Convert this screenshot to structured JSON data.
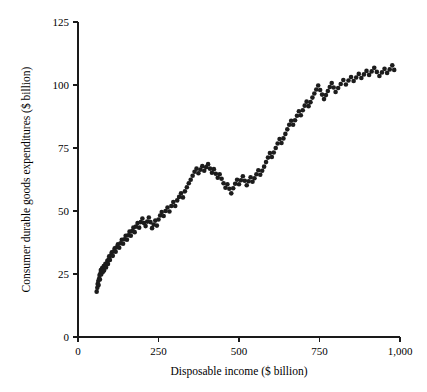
{
  "chart_data": {
    "type": "scatter",
    "title": "",
    "xlabel": "Disposable income ($ billion)",
    "ylabel": "Consumer durable goods expenditures ($ billion)",
    "xlim": [
      0,
      1000
    ],
    "ylim": [
      0,
      125
    ],
    "xticks": [
      0,
      250,
      500,
      750,
      1000
    ],
    "xtick_labels": [
      "0",
      "250",
      "500",
      "750",
      "1,000"
    ],
    "yticks": [
      0,
      25,
      50,
      75,
      100,
      125
    ],
    "ytick_labels": [
      "0",
      "25",
      "50",
      "75",
      "100",
      "125"
    ],
    "grid": false,
    "legend": null,
    "marker": {
      "shape": "circle",
      "color": "#1c1c1c",
      "size_px": 4.6
    },
    "series": [
      {
        "name": "Consumer durable goods expenditures vs disposable income",
        "color": "#1c1c1c",
        "points": [
          [
            58,
            18.0
          ],
          [
            60,
            19.5
          ],
          [
            61,
            21.0
          ],
          [
            63,
            22.2
          ],
          [
            64,
            20.6
          ],
          [
            66,
            23.3
          ],
          [
            67,
            24.6
          ],
          [
            68,
            22.8
          ],
          [
            70,
            25.4
          ],
          [
            71,
            26.6
          ],
          [
            72,
            24.8
          ],
          [
            74,
            26.0
          ],
          [
            75,
            27.4
          ],
          [
            77,
            25.8
          ],
          [
            78,
            27.0
          ],
          [
            80,
            28.2
          ],
          [
            81,
            26.4
          ],
          [
            83,
            27.8
          ],
          [
            85,
            29.0
          ],
          [
            87,
            27.6
          ],
          [
            89,
            28.8
          ],
          [
            91,
            30.2
          ],
          [
            93,
            29.0
          ],
          [
            95,
            30.8
          ],
          [
            97,
            32.0
          ],
          [
            99,
            30.6
          ],
          [
            102,
            32.4
          ],
          [
            105,
            33.6
          ],
          [
            108,
            32.2
          ],
          [
            111,
            34.0
          ],
          [
            114,
            35.2
          ],
          [
            117,
            33.8
          ],
          [
            120,
            35.6
          ],
          [
            124,
            36.8
          ],
          [
            128,
            35.4
          ],
          [
            132,
            37.2
          ],
          [
            136,
            38.6
          ],
          [
            140,
            37.0
          ],
          [
            144,
            38.8
          ],
          [
            148,
            40.2
          ],
          [
            152,
            38.6
          ],
          [
            156,
            40.4
          ],
          [
            160,
            41.8
          ],
          [
            164,
            40.2
          ],
          [
            168,
            42.0
          ],
          [
            172,
            43.4
          ],
          [
            176,
            41.6
          ],
          [
            180,
            43.8
          ],
          [
            185,
            45.2
          ],
          [
            190,
            43.4
          ],
          [
            195,
            45.6
          ],
          [
            200,
            47.0
          ],
          [
            205,
            45.2
          ],
          [
            210,
            44.0
          ],
          [
            215,
            45.8
          ],
          [
            220,
            47.4
          ],
          [
            225,
            45.6
          ],
          [
            230,
            43.2
          ],
          [
            235,
            44.6
          ],
          [
            240,
            46.2
          ],
          [
            245,
            44.2
          ],
          [
            250,
            46.6
          ],
          [
            255,
            48.2
          ],
          [
            260,
            49.6
          ],
          [
            266,
            48.0
          ],
          [
            272,
            50.0
          ],
          [
            278,
            51.4
          ],
          [
            284,
            49.8
          ],
          [
            290,
            52.0
          ],
          [
            296,
            53.6
          ],
          [
            302,
            52.0
          ],
          [
            308,
            54.2
          ],
          [
            314,
            55.6
          ],
          [
            320,
            57.0
          ],
          [
            326,
            55.4
          ],
          [
            332,
            57.8
          ],
          [
            338,
            59.4
          ],
          [
            344,
            61.0
          ],
          [
            350,
            62.4
          ],
          [
            356,
            64.0
          ],
          [
            362,
            65.6
          ],
          [
            368,
            66.8
          ],
          [
            374,
            65.0
          ],
          [
            380,
            66.4
          ],
          [
            386,
            67.8
          ],
          [
            392,
            66.0
          ],
          [
            398,
            67.4
          ],
          [
            404,
            68.6
          ],
          [
            410,
            66.8
          ],
          [
            416,
            65.2
          ],
          [
            422,
            66.6
          ],
          [
            428,
            64.8
          ],
          [
            434,
            63.2
          ],
          [
            440,
            64.6
          ],
          [
            446,
            62.8
          ],
          [
            452,
            61.0
          ],
          [
            458,
            59.2
          ],
          [
            464,
            60.6
          ],
          [
            470,
            58.8
          ],
          [
            476,
            57.0
          ],
          [
            482,
            59.0
          ],
          [
            488,
            60.8
          ],
          [
            494,
            62.4
          ],
          [
            500,
            60.6
          ],
          [
            506,
            62.2
          ],
          [
            512,
            63.8
          ],
          [
            518,
            62.0
          ],
          [
            524,
            60.2
          ],
          [
            530,
            61.8
          ],
          [
            536,
            63.4
          ],
          [
            542,
            61.6
          ],
          [
            548,
            63.0
          ],
          [
            554,
            64.6
          ],
          [
            560,
            66.2
          ],
          [
            566,
            64.4
          ],
          [
            572,
            66.0
          ],
          [
            578,
            67.6
          ],
          [
            584,
            69.4
          ],
          [
            590,
            71.2
          ],
          [
            596,
            73.0
          ],
          [
            602,
            71.4
          ],
          [
            608,
            73.2
          ],
          [
            614,
            75.0
          ],
          [
            620,
            76.8
          ],
          [
            626,
            78.6
          ],
          [
            632,
            77.0
          ],
          [
            638,
            78.8
          ],
          [
            644,
            80.6
          ],
          [
            650,
            82.4
          ],
          [
            656,
            84.2
          ],
          [
            662,
            85.8
          ],
          [
            668,
            84.2
          ],
          [
            674,
            86.0
          ],
          [
            680,
            87.8
          ],
          [
            686,
            89.6
          ],
          [
            692,
            88.0
          ],
          [
            698,
            90.0
          ],
          [
            704,
            91.8
          ],
          [
            710,
            93.4
          ],
          [
            716,
            91.6
          ],
          [
            722,
            93.2
          ],
          [
            728,
            95.0
          ],
          [
            734,
            96.6
          ],
          [
            740,
            98.2
          ],
          [
            746,
            99.8
          ],
          [
            752,
            98.0
          ],
          [
            758,
            96.2
          ],
          [
            764,
            94.4
          ],
          [
            770,
            96.0
          ],
          [
            776,
            97.6
          ],
          [
            782,
            99.2
          ],
          [
            788,
            100.8
          ],
          [
            794,
            99.0
          ],
          [
            800,
            97.2
          ],
          [
            808,
            98.8
          ],
          [
            816,
            100.4
          ],
          [
            824,
            102.0
          ],
          [
            832,
            100.2
          ],
          [
            840,
            101.8
          ],
          [
            848,
            103.2
          ],
          [
            856,
            101.6
          ],
          [
            864,
            103.0
          ],
          [
            872,
            104.4
          ],
          [
            880,
            102.8
          ],
          [
            888,
            104.2
          ],
          [
            896,
            105.6
          ],
          [
            904,
            104.0
          ],
          [
            912,
            105.4
          ],
          [
            920,
            106.8
          ],
          [
            928,
            105.2
          ],
          [
            936,
            103.6
          ],
          [
            944,
            105.0
          ],
          [
            952,
            106.4
          ],
          [
            960,
            104.8
          ],
          [
            968,
            106.2
          ],
          [
            976,
            107.8
          ],
          [
            982,
            106.0
          ]
        ]
      }
    ]
  }
}
